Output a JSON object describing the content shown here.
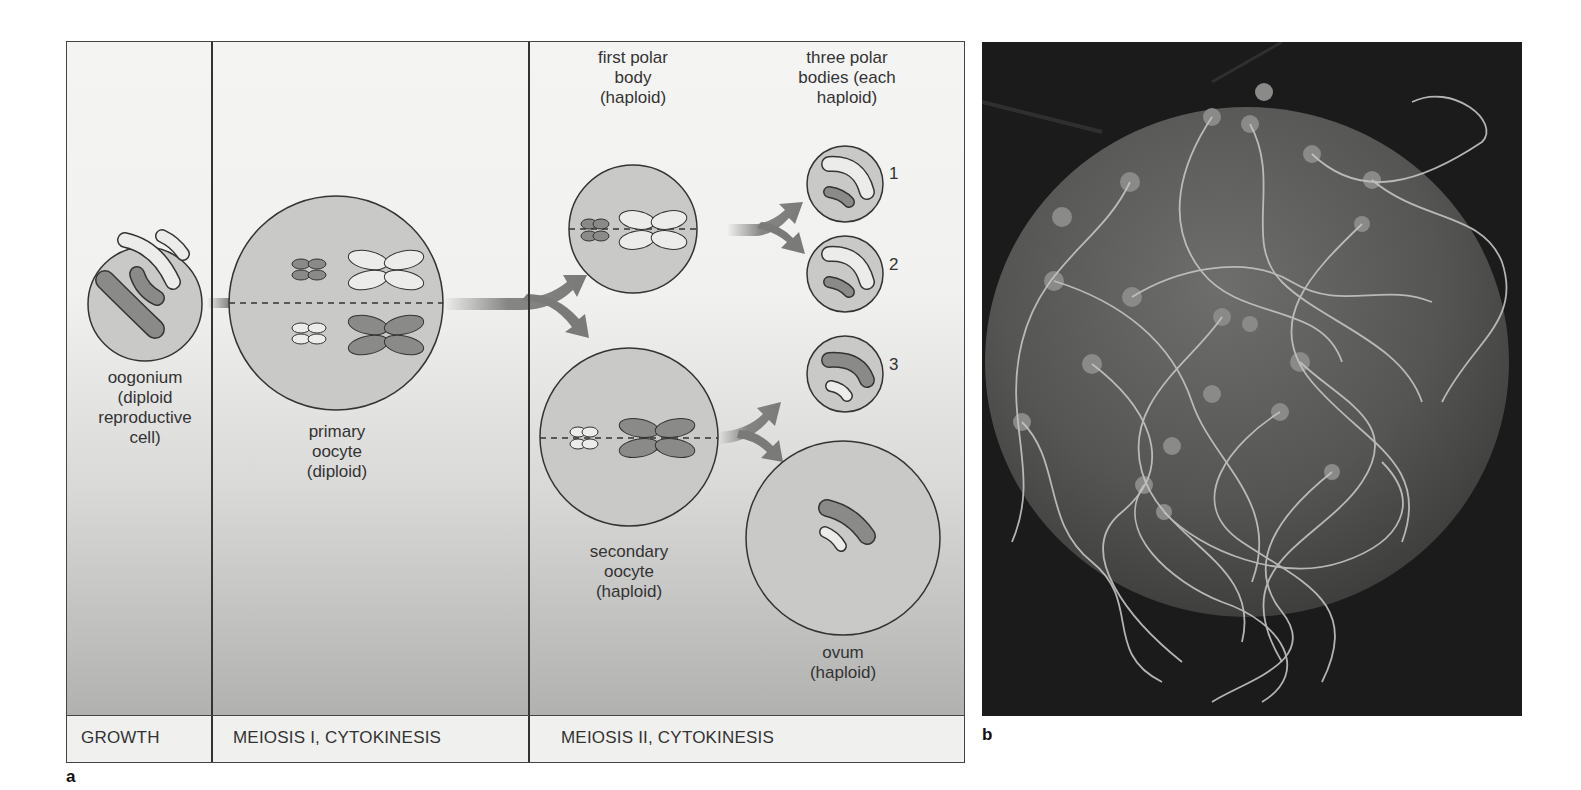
{
  "figure": {
    "panel_a": {
      "label": "a",
      "stages": [
        {
          "id": "oogonium",
          "text": "oogonium\n(diploid\nreproductive\ncell)"
        },
        {
          "id": "primary_oocyte",
          "text": "primary\noocyte\n(diploid)"
        },
        {
          "id": "first_polar_body",
          "text": "first polar\nbody\n(haploid)"
        },
        {
          "id": "three_polar_bodies",
          "text": "three polar\nbodies (each\nhaploid)"
        },
        {
          "id": "secondary_oocyte",
          "text": "secondary\noocyte\n(haploid)"
        },
        {
          "id": "ovum",
          "text": "ovum\n(haploid)"
        }
      ],
      "polar_body_numbers": [
        "1",
        "2",
        "3"
      ],
      "phases": [
        "GROWTH",
        "MEIOSIS I, CYTOKINESIS",
        "MEIOSIS II, CYTOKINESIS"
      ]
    },
    "panel_b": {
      "label": "b",
      "description": "scanning electron micrograph of sperm surrounding an egg"
    },
    "colors": {
      "cell_fill": "#c9c9c8",
      "chromosome_dark": "#8a8a89",
      "chromosome_light": "#ececeb",
      "arrow": "#7a7a79",
      "outline": "#333333"
    }
  }
}
